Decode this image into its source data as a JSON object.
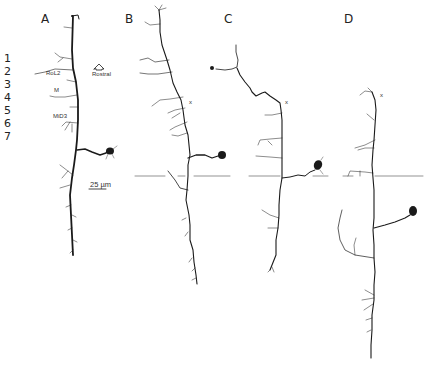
{
  "figure": {
    "panels": [
      {
        "id": "A",
        "label": "A"
      },
      {
        "id": "B",
        "label": "B"
      },
      {
        "id": "C",
        "label": "C"
      },
      {
        "id": "D",
        "label": "D"
      }
    ],
    "row_numbers": [
      "1",
      "2",
      "3",
      "4",
      "5",
      "6",
      "7"
    ],
    "annotations": {
      "rol2": "RoL2",
      "m": "M",
      "md3": "MiD3",
      "rostral": "Rostral",
      "rostral_icon": "arrow-up-outline",
      "scale_bar": "25 µm",
      "marker_x": "x",
      "marker_star": "*"
    },
    "colors": {
      "ink": "#1a1a1a",
      "midline": "#555555",
      "background": "#ffffff"
    }
  }
}
